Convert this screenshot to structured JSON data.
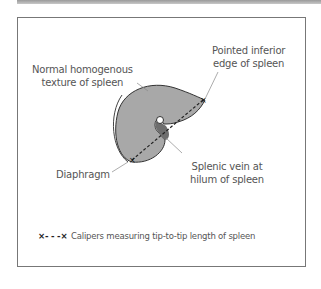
{
  "diagram": {
    "labels": {
      "pointed_edge": "Pointed inferior\nedge of spleen",
      "texture": "Normal homogenous\ntexture of spleen",
      "diaphragm": "Diaphragm",
      "splenic_vein": "Splenic vein at\nhilum of spleen"
    },
    "legend": {
      "symbol": "×- - -×",
      "text": "Calipers measuring tip-to-tip length of spleen"
    },
    "colors": {
      "spleen_fill": "#a8a8a8",
      "vein_fill": "#6e6e6e",
      "outline": "#333333",
      "frame": "#777777"
    }
  }
}
